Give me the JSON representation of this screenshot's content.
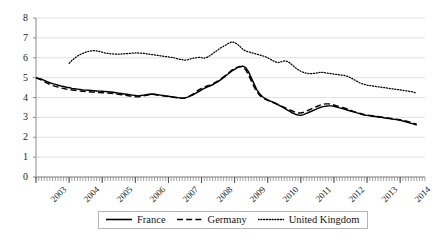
{
  "chart_data": {
    "type": "line",
    "title": "",
    "subtitle": "",
    "xlabel": "",
    "ylabel": "",
    "xlim": [
      2003.0,
      2014.75
    ],
    "ylim": [
      0,
      8
    ],
    "yticks": [
      0,
      1,
      2,
      3,
      4,
      5,
      6,
      7,
      8
    ],
    "xticks": [
      "2003",
      "2004",
      "2005",
      "2006",
      "2007",
      "2008",
      "2009",
      "2010",
      "2011",
      "2012",
      "2013",
      "2014"
    ],
    "grid": true,
    "legend_position": "bottom",
    "x_tick_rotation": -45,
    "minor_tick_interval_months": 1,
    "series": [
      {
        "name": "France",
        "style": "solid",
        "color": "#000000",
        "x": [
          2003.0,
          2003.083,
          2003.167,
          2003.25,
          2003.333,
          2003.417,
          2003.5,
          2003.583,
          2003.667,
          2003.75,
          2003.833,
          2003.917,
          2004.0,
          2004.083,
          2004.167,
          2004.25,
          2004.333,
          2004.417,
          2004.5,
          2004.583,
          2004.667,
          2004.75,
          2004.833,
          2004.917,
          2005.0,
          2005.083,
          2005.167,
          2005.25,
          2005.333,
          2005.417,
          2005.5,
          2005.583,
          2005.667,
          2005.75,
          2005.833,
          2005.917,
          2006.0,
          2006.083,
          2006.167,
          2006.25,
          2006.333,
          2006.417,
          2006.5,
          2006.583,
          2006.667,
          2006.75,
          2006.833,
          2006.917,
          2007.0,
          2007.083,
          2007.167,
          2007.25,
          2007.333,
          2007.417,
          2007.5,
          2007.583,
          2007.667,
          2007.75,
          2007.833,
          2007.917,
          2008.0,
          2008.083,
          2008.167,
          2008.25,
          2008.333,
          2008.417,
          2008.5,
          2008.583,
          2008.667,
          2008.75,
          2008.833,
          2008.917,
          2009.0,
          2009.083,
          2009.167,
          2009.25,
          2009.333,
          2009.417,
          2009.5,
          2009.583,
          2009.667,
          2009.75,
          2009.833,
          2009.917,
          2010.0,
          2010.083,
          2010.167,
          2010.25,
          2010.333,
          2010.417,
          2010.5,
          2010.583,
          2010.667,
          2010.75,
          2010.833,
          2010.917,
          2011.0,
          2011.083,
          2011.167,
          2011.25,
          2011.333,
          2011.417,
          2011.5,
          2011.583,
          2011.667,
          2011.75,
          2011.833,
          2011.917,
          2012.0,
          2012.083,
          2012.167,
          2012.25,
          2012.333,
          2012.417,
          2012.5,
          2012.583,
          2012.667,
          2012.75,
          2012.833,
          2012.917,
          2013.0,
          2013.083,
          2013.167,
          2013.25,
          2013.333,
          2013.417,
          2013.5,
          2013.583,
          2013.667,
          2013.75,
          2013.833,
          2013.917,
          2014.0,
          2014.083,
          2014.167,
          2014.25,
          2014.333,
          2014.417,
          2014.5
        ],
        "values": [
          4.98,
          4.96,
          4.92,
          4.86,
          4.8,
          4.74,
          4.7,
          4.66,
          4.62,
          4.58,
          4.55,
          4.52,
          4.5,
          4.46,
          4.44,
          4.42,
          4.4,
          4.38,
          4.37,
          4.36,
          4.35,
          4.34,
          4.33,
          4.32,
          4.31,
          4.3,
          4.29,
          4.28,
          4.26,
          4.24,
          4.22,
          4.2,
          4.18,
          4.16,
          4.14,
          4.12,
          4.1,
          4.08,
          4.1,
          4.12,
          4.14,
          4.16,
          4.18,
          4.16,
          4.14,
          4.12,
          4.1,
          4.08,
          4.06,
          4.04,
          4.02,
          4.0,
          3.98,
          3.96,
          3.98,
          4.02,
          4.08,
          4.14,
          4.22,
          4.3,
          4.38,
          4.46,
          4.52,
          4.58,
          4.64,
          4.72,
          4.8,
          4.9,
          5.0,
          5.12,
          5.22,
          5.34,
          5.42,
          5.5,
          5.55,
          5.58,
          5.5,
          5.3,
          5.0,
          4.7,
          4.4,
          4.2,
          4.05,
          3.95,
          3.88,
          3.82,
          3.76,
          3.7,
          3.62,
          3.54,
          3.46,
          3.38,
          3.3,
          3.22,
          3.16,
          3.12,
          3.1,
          3.14,
          3.2,
          3.26,
          3.32,
          3.38,
          3.44,
          3.5,
          3.54,
          3.56,
          3.58,
          3.58,
          3.56,
          3.52,
          3.48,
          3.44,
          3.4,
          3.36,
          3.32,
          3.28,
          3.24,
          3.2,
          3.16,
          3.12,
          3.1,
          3.08,
          3.06,
          3.04,
          3.02,
          3.0,
          2.98,
          2.96,
          2.94,
          2.92,
          2.9,
          2.88,
          2.85,
          2.82,
          2.78,
          2.74,
          2.7,
          2.66,
          2.62
        ]
      },
      {
        "name": "Germany",
        "style": "dashed",
        "color": "#000000",
        "x": [
          2003.0,
          2003.083,
          2003.167,
          2003.25,
          2003.333,
          2003.417,
          2003.5,
          2003.583,
          2003.667,
          2003.75,
          2003.833,
          2003.917,
          2004.0,
          2004.083,
          2004.167,
          2004.25,
          2004.333,
          2004.417,
          2004.5,
          2004.583,
          2004.667,
          2004.75,
          2004.833,
          2004.917,
          2005.0,
          2005.083,
          2005.167,
          2005.25,
          2005.333,
          2005.417,
          2005.5,
          2005.583,
          2005.667,
          2005.75,
          2005.833,
          2005.917,
          2006.0,
          2006.083,
          2006.167,
          2006.25,
          2006.333,
          2006.417,
          2006.5,
          2006.583,
          2006.667,
          2006.75,
          2006.833,
          2006.917,
          2007.0,
          2007.083,
          2007.167,
          2007.25,
          2007.333,
          2007.417,
          2007.5,
          2007.583,
          2007.667,
          2007.75,
          2007.833,
          2007.917,
          2008.0,
          2008.083,
          2008.167,
          2008.25,
          2008.333,
          2008.417,
          2008.5,
          2008.583,
          2008.667,
          2008.75,
          2008.833,
          2008.917,
          2009.0,
          2009.083,
          2009.167,
          2009.25,
          2009.333,
          2009.417,
          2009.5,
          2009.583,
          2009.667,
          2009.75,
          2009.833,
          2009.917,
          2010.0,
          2010.083,
          2010.167,
          2010.25,
          2010.333,
          2010.417,
          2010.5,
          2010.583,
          2010.667,
          2010.75,
          2010.833,
          2010.917,
          2011.0,
          2011.083,
          2011.167,
          2011.25,
          2011.333,
          2011.417,
          2011.5,
          2011.583,
          2011.667,
          2011.75,
          2011.833,
          2011.917,
          2012.0,
          2012.083,
          2012.167,
          2012.25,
          2012.333,
          2012.417,
          2012.5,
          2012.583,
          2012.667,
          2012.75,
          2012.833,
          2012.917,
          2013.0,
          2013.083,
          2013.167,
          2013.25,
          2013.333,
          2013.417,
          2013.5,
          2013.583,
          2013.667,
          2013.75,
          2013.833,
          2013.917,
          2014.0,
          2014.083,
          2014.167,
          2014.25,
          2014.333,
          2014.417,
          2014.5
        ],
        "values": [
          4.98,
          4.94,
          4.88,
          4.8,
          4.72,
          4.66,
          4.6,
          4.56,
          4.52,
          4.48,
          4.45,
          4.42,
          4.4,
          4.38,
          4.36,
          4.34,
          4.32,
          4.31,
          4.3,
          4.29,
          4.28,
          4.27,
          4.26,
          4.25,
          4.24,
          4.23,
          4.22,
          4.21,
          4.2,
          4.18,
          4.16,
          4.14,
          4.12,
          4.1,
          4.08,
          4.06,
          4.04,
          4.03,
          4.05,
          4.08,
          4.11,
          4.14,
          4.16,
          4.15,
          4.13,
          4.11,
          4.09,
          4.07,
          4.05,
          4.03,
          4.01,
          3.99,
          3.97,
          3.96,
          3.98,
          4.03,
          4.1,
          4.18,
          4.28,
          4.38,
          4.46,
          4.52,
          4.58,
          4.62,
          4.68,
          4.76,
          4.84,
          4.94,
          5.04,
          5.14,
          5.26,
          5.38,
          5.46,
          5.52,
          5.56,
          5.52,
          5.4,
          5.15,
          4.85,
          4.55,
          4.3,
          4.12,
          4.0,
          3.92,
          3.86,
          3.8,
          3.74,
          3.68,
          3.62,
          3.56,
          3.5,
          3.44,
          3.38,
          3.32,
          3.26,
          3.22,
          3.22,
          3.26,
          3.32,
          3.38,
          3.44,
          3.5,
          3.56,
          3.62,
          3.66,
          3.68,
          3.68,
          3.66,
          3.62,
          3.58,
          3.54,
          3.5,
          3.46,
          3.42,
          3.36,
          3.3,
          3.26,
          3.22,
          3.18,
          3.14,
          3.12,
          3.1,
          3.08,
          3.06,
          3.04,
          3.02,
          3.0,
          2.98,
          2.96,
          2.94,
          2.92,
          2.9,
          2.88,
          2.85,
          2.82,
          2.78,
          2.74,
          2.7,
          2.66
        ]
      },
      {
        "name": "United Kingdom",
        "style": "dotted",
        "color": "#000000",
        "x": [
          2004.0,
          2004.083,
          2004.167,
          2004.25,
          2004.333,
          2004.417,
          2004.5,
          2004.583,
          2004.667,
          2004.75,
          2004.833,
          2004.917,
          2005.0,
          2005.083,
          2005.167,
          2005.25,
          2005.333,
          2005.417,
          2005.5,
          2005.583,
          2005.667,
          2005.75,
          2005.833,
          2005.917,
          2006.0,
          2006.083,
          2006.167,
          2006.25,
          2006.333,
          2006.417,
          2006.5,
          2006.583,
          2006.667,
          2006.75,
          2006.833,
          2006.917,
          2007.0,
          2007.083,
          2007.167,
          2007.25,
          2007.333,
          2007.417,
          2007.5,
          2007.583,
          2007.667,
          2007.75,
          2007.833,
          2007.917,
          2008.0,
          2008.083,
          2008.167,
          2008.25,
          2008.333,
          2008.417,
          2008.5,
          2008.583,
          2008.667,
          2008.75,
          2008.833,
          2008.917,
          2009.0,
          2009.083,
          2009.167,
          2009.25,
          2009.333,
          2009.417,
          2009.5,
          2009.583,
          2009.667,
          2009.75,
          2009.833,
          2009.917,
          2010.0,
          2010.083,
          2010.167,
          2010.25,
          2010.333,
          2010.417,
          2010.5,
          2010.583,
          2010.667,
          2010.75,
          2010.833,
          2010.917,
          2011.0,
          2011.083,
          2011.167,
          2011.25,
          2011.333,
          2011.417,
          2011.5,
          2011.583,
          2011.667,
          2011.75,
          2011.833,
          2011.917,
          2012.0,
          2012.083,
          2012.167,
          2012.25,
          2012.333,
          2012.417,
          2012.5,
          2012.583,
          2012.667,
          2012.75,
          2012.833,
          2012.917,
          2013.0,
          2013.083,
          2013.167,
          2013.25,
          2013.333,
          2013.417,
          2013.5,
          2013.583,
          2013.667,
          2013.75,
          2013.833,
          2013.917,
          2014.0,
          2014.083,
          2014.167,
          2014.25,
          2014.333,
          2014.417,
          2014.5
        ],
        "values": [
          5.72,
          5.86,
          5.98,
          6.08,
          6.16,
          6.22,
          6.28,
          6.32,
          6.35,
          6.36,
          6.34,
          6.32,
          6.28,
          6.24,
          6.22,
          6.2,
          6.19,
          6.18,
          6.18,
          6.19,
          6.2,
          6.21,
          6.22,
          6.23,
          6.24,
          6.24,
          6.23,
          6.22,
          6.2,
          6.18,
          6.16,
          6.14,
          6.12,
          6.1,
          6.08,
          6.06,
          6.04,
          6.02,
          6.0,
          5.96,
          5.92,
          5.9,
          5.88,
          5.9,
          5.94,
          5.98,
          6.0,
          6.02,
          6.0,
          5.98,
          6.02,
          6.1,
          6.2,
          6.3,
          6.4,
          6.5,
          6.58,
          6.66,
          6.74,
          6.8,
          6.76,
          6.68,
          6.56,
          6.42,
          6.34,
          6.3,
          6.26,
          6.22,
          6.18,
          6.14,
          6.1,
          6.06,
          6.0,
          5.92,
          5.84,
          5.78,
          5.76,
          5.8,
          5.84,
          5.82,
          5.74,
          5.62,
          5.5,
          5.4,
          5.32,
          5.26,
          5.22,
          5.2,
          5.2,
          5.22,
          5.24,
          5.26,
          5.26,
          5.24,
          5.22,
          5.2,
          5.18,
          5.16,
          5.14,
          5.12,
          5.1,
          5.06,
          5.0,
          4.92,
          4.84,
          4.76,
          4.7,
          4.66,
          4.62,
          4.6,
          4.58,
          4.56,
          4.54,
          4.52,
          4.5,
          4.48,
          4.46,
          4.44,
          4.42,
          4.4,
          4.38,
          4.36,
          4.34,
          4.32,
          4.3,
          4.26,
          4.22
        ]
      }
    ]
  },
  "axis": {
    "y_labels": [
      "8",
      "7",
      "6",
      "5",
      "4",
      "3",
      "2",
      "1",
      "0"
    ],
    "x_labels": [
      "2003",
      "2004",
      "2005",
      "2006",
      "2007",
      "2008",
      "2009",
      "2010",
      "2011",
      "2012",
      "2013",
      "2014"
    ]
  },
  "legend": {
    "items": [
      {
        "label": "France",
        "style": "solid"
      },
      {
        "label": "Germany",
        "style": "dashed"
      },
      {
        "label": "United Kingdom",
        "style": "dotted"
      }
    ]
  },
  "colors": {
    "line": "#000000",
    "grid": "#d9d9d9",
    "axis": "#8a8a8a",
    "text": "#1a1a1a",
    "legend_border": "#b4b4b4",
    "background": "#ffffff"
  }
}
